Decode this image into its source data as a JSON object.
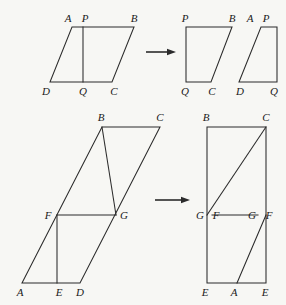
{
  "page": {
    "background_color": "#f7f7f4",
    "ink_color": "#2b2b2b",
    "width": 286,
    "height": 305
  },
  "figures": [
    {
      "id": "figure-top",
      "caption": "Parallelogram ABCD cut along PQ and rearranged into a rectangle",
      "source_shape": {
        "name": "parallelogram-abcd",
        "vertices": [
          {
            "label": "A",
            "x": 72,
            "y": 27
          },
          {
            "label": "B",
            "x": 134,
            "y": 27
          },
          {
            "label": "C",
            "x": 112,
            "y": 82
          },
          {
            "label": "D",
            "x": 50,
            "y": 82
          }
        ],
        "cut_segment": {
          "from": {
            "label": "P",
            "x": 83,
            "y": 27
          },
          "to": {
            "label": "Q",
            "x": 83,
            "y": 82
          }
        },
        "labels": [
          {
            "text": "A",
            "x": 68,
            "y": 22,
            "anchor": "middle"
          },
          {
            "text": "P",
            "x": 85,
            "y": 22,
            "anchor": "middle"
          },
          {
            "text": "B",
            "x": 134,
            "y": 22,
            "anchor": "middle"
          },
          {
            "text": "D",
            "x": 46,
            "y": 95,
            "anchor": "middle"
          },
          {
            "text": "Q",
            "x": 83,
            "y": 95,
            "anchor": "middle"
          },
          {
            "text": "C",
            "x": 114,
            "y": 95,
            "anchor": "middle"
          }
        ]
      },
      "result_shapes": [
        {
          "name": "rectangle-pbcq",
          "path": "M 186 27 L 232 27 L 211 82 L 186 82 Z",
          "labels": [
            {
              "text": "P",
              "x": 185,
              "y": 22,
              "anchor": "middle"
            },
            {
              "text": "B",
              "x": 232,
              "y": 22,
              "anchor": "middle"
            },
            {
              "text": "Q",
              "x": 185,
              "y": 95,
              "anchor": "middle"
            },
            {
              "text": "C",
              "x": 212,
              "y": 95,
              "anchor": "middle"
            }
          ]
        },
        {
          "name": "piece-apqd",
          "path": "M 239 82 L 261 27 L 277 27 L 277 82 Z",
          "labels": [
            {
              "text": "A",
              "x": 250,
              "y": 22,
              "anchor": "middle"
            },
            {
              "text": "P",
              "x": 266,
              "y": 22,
              "anchor": "middle"
            },
            {
              "text": "D",
              "x": 240,
              "y": 95,
              "anchor": "middle"
            },
            {
              "text": "Q",
              "x": 274,
              "y": 95,
              "anchor": "middle"
            }
          ]
        }
      ],
      "arrow": {
        "x1": 146,
        "y1": 52,
        "x2": 176,
        "y2": 52
      }
    },
    {
      "id": "figure-bottom",
      "caption": "Parallelogram ABCD with segment FG rearranged into a tall rectangle",
      "source_shape": {
        "name": "parallelogram-abcd-tall",
        "path": "M 22 283 L 102 127 L 160 127 L 80 283 Z",
        "segments": [
          {
            "name": "segment-bg",
            "x1": 102,
            "y1": 127,
            "x2": 116,
            "y2": 215
          },
          {
            "name": "segment-fg",
            "x1": 57,
            "y1": 215,
            "x2": 116,
            "y2": 215
          },
          {
            "name": "segment-ef",
            "x1": 57,
            "y1": 215,
            "x2": 57,
            "y2": 283
          }
        ],
        "labels": [
          {
            "text": "B",
            "x": 101,
            "y": 121,
            "anchor": "middle"
          },
          {
            "text": "C",
            "x": 160,
            "y": 121,
            "anchor": "middle"
          },
          {
            "text": "F",
            "x": 48,
            "y": 219,
            "anchor": "middle"
          },
          {
            "text": "G",
            "x": 124,
            "y": 219,
            "anchor": "middle"
          },
          {
            "text": "A",
            "x": 20,
            "y": 296,
            "anchor": "middle"
          },
          {
            "text": "E",
            "x": 59,
            "y": 296,
            "anchor": "middle"
          },
          {
            "text": "D",
            "x": 80,
            "y": 296,
            "anchor": "middle"
          }
        ]
      },
      "result_shapes": [
        {
          "name": "rectangle-bcee",
          "path": "M 207 127 L 266 127 L 266 283 L 207 283 Z",
          "segments": [
            {
              "name": "diagonal-gc",
              "x1": 207,
              "y1": 215,
              "x2": 266,
              "y2": 127
            },
            {
              "name": "diagonal-af",
              "x1": 237,
              "y1": 283,
              "x2": 266,
              "y2": 215
            },
            {
              "name": "segment-fg-mid",
              "x1": 212,
              "y1": 215,
              "x2": 258,
              "y2": 215
            }
          ],
          "labels": [
            {
              "text": "B",
              "x": 206,
              "y": 121,
              "anchor": "middle"
            },
            {
              "text": "C",
              "x": 266,
              "y": 121,
              "anchor": "middle"
            },
            {
              "text": "G",
              "x": 200,
              "y": 219,
              "anchor": "middle"
            },
            {
              "text": "F",
              "x": 216,
              "y": 219,
              "anchor": "middle"
            },
            {
              "text": "G",
              "x": 252,
              "y": 219,
              "anchor": "middle"
            },
            {
              "text": "F",
              "x": 269,
              "y": 219,
              "anchor": "middle"
            },
            {
              "text": "E",
              "x": 205,
              "y": 296,
              "anchor": "middle"
            },
            {
              "text": "A",
              "x": 234,
              "y": 296,
              "anchor": "middle"
            },
            {
              "text": "E",
              "x": 265,
              "y": 296,
              "anchor": "middle"
            }
          ]
        }
      ],
      "arrow": {
        "x1": 155,
        "y1": 200,
        "x2": 190,
        "y2": 200
      }
    }
  ]
}
